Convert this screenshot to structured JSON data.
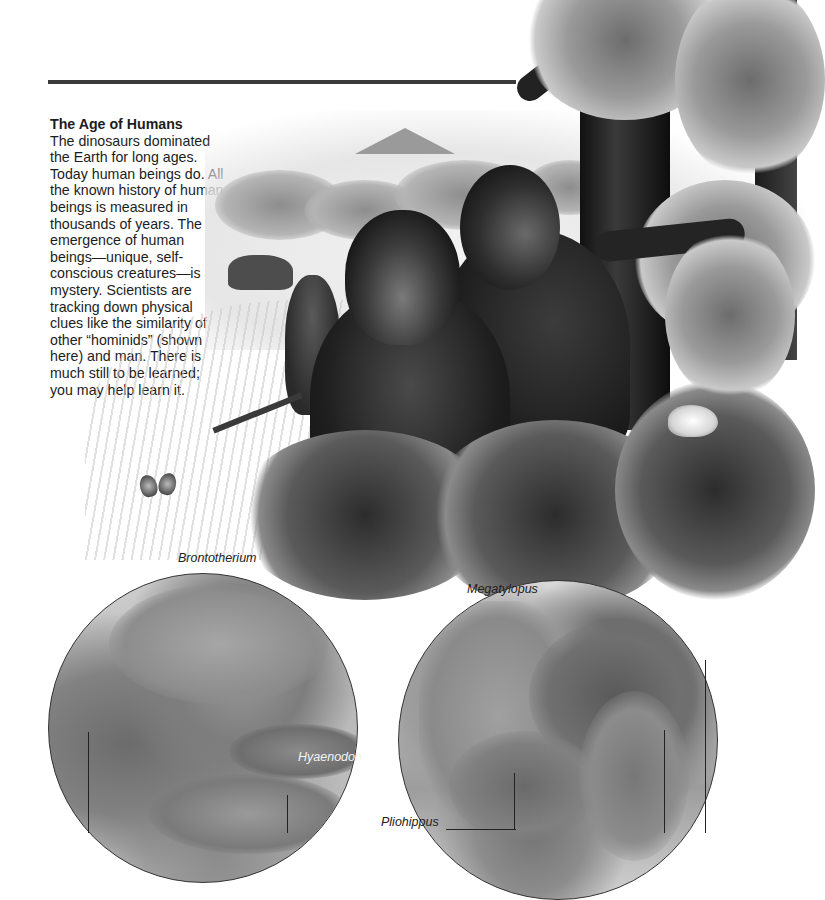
{
  "page": {
    "section_title": "The Age of Humans",
    "body_text": "The dinosaurs dominated the Earth for long ages. Today human beings do. All the known history of human beings is measured in thousands of years. The emergence of human beings—unique, self-conscious creatures—is a mystery. Scientists are tracking down physical clues like the similarity of other “hominids” (shown here) and man. There is much still to be learned; you may help learn it."
  },
  "illustration": {
    "subject": "hominids in savanna landscape",
    "color_mode": "greyscale"
  },
  "vignettes": [
    {
      "position": "left",
      "labels": [
        "Brontotherium",
        "Hyaenodon"
      ]
    },
    {
      "position": "right",
      "labels": [
        "Megatylopus",
        "Pliohippus"
      ]
    }
  ]
}
